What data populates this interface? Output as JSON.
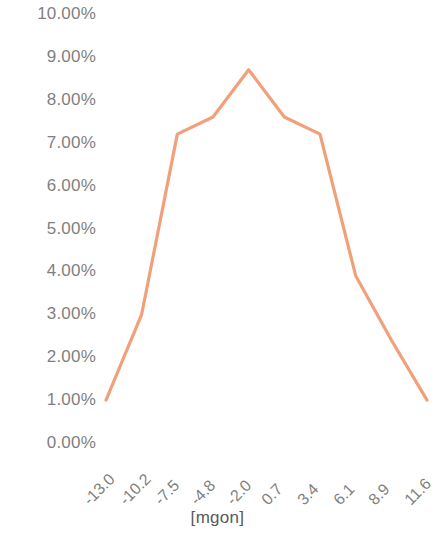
{
  "chart_data": {
    "type": "line",
    "title": "",
    "subtitle": "",
    "xlabel": "[mgon]",
    "ylabel": "",
    "categories": [
      "-13.0",
      "-10.2",
      "-7.5",
      "-4.8",
      "-2.0",
      "0.7",
      "3.4",
      "6.1",
      "8.9",
      "11.6"
    ],
    "values": [
      1.0,
      3.0,
      7.2,
      7.6,
      8.7,
      7.6,
      7.2,
      3.9,
      2.4,
      1.0
    ],
    "value_labels": [
      "1.00%",
      "3.00%",
      "7.20%",
      "7.60%",
      "8.70%",
      "7.60%",
      "7.20%",
      "3.90%",
      "2.40%",
      "1.00%"
    ],
    "ylim": [
      0,
      10
    ],
    "ytick_labels": [
      "10.00%",
      "9.00%",
      "8.00%",
      "7.00%",
      "6.00%",
      "5.00%",
      "4.00%",
      "3.00%",
      "2.00%",
      "1.00%",
      "0.00%"
    ],
    "ytick_values": [
      10,
      9,
      8,
      7,
      6,
      5,
      4,
      3,
      2,
      1,
      0
    ],
    "grid": false,
    "legend": false,
    "legend_position": "none",
    "series": [
      {
        "name": "distribution",
        "color": "#F0A07A",
        "values": [
          1.0,
          3.0,
          7.2,
          7.6,
          8.7,
          7.6,
          7.2,
          3.9,
          2.4,
          1.0
        ]
      }
    ],
    "line_color": "#F0A07A",
    "axis_label_color": "#7f7f7f",
    "background_color": "#ffffff"
  }
}
